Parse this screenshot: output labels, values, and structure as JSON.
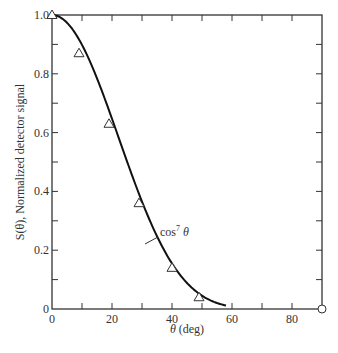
{
  "chart_data": {
    "type": "line",
    "title": "",
    "xlabel": "θ (deg)",
    "ylabel": "S(θ), Normalized detector signal",
    "xlim": [
      0,
      90
    ],
    "ylim": [
      0,
      1.0
    ],
    "x_ticks": [
      0,
      20,
      40,
      60,
      80
    ],
    "x_tick_labels": [
      "0",
      "20",
      "40",
      "60",
      "80"
    ],
    "x_minor_ticks": [
      10,
      30,
      50,
      70
    ],
    "y_ticks": [
      0,
      0.2,
      0.4,
      0.6,
      0.8,
      1.0
    ],
    "y_tick_labels": [
      "0",
      "0.2",
      "0.4",
      "0.6",
      "0.8",
      "1.0"
    ],
    "y_minor_ticks": [
      0.1,
      0.3,
      0.5,
      0.7,
      0.9
    ],
    "grid": false,
    "annotations": [
      {
        "text": "cos⁷ θ",
        "x": 36,
        "y": 0.27,
        "points_to": [
          31,
          0.22
        ]
      }
    ],
    "series": [
      {
        "name": "cos^7 θ",
        "kind": "curve",
        "function": "cos(theta)^7",
        "x_range": [
          0,
          90
        ]
      },
      {
        "name": "measured",
        "kind": "markers",
        "marker": "triangle-open",
        "x": [
          0,
          9,
          19,
          29,
          40,
          49
        ],
        "y": [
          1.0,
          0.87,
          0.63,
          0.36,
          0.14,
          0.04
        ]
      },
      {
        "name": "endpoint",
        "kind": "markers",
        "marker": "circle-open",
        "x": [
          90
        ],
        "y": [
          0
        ]
      }
    ]
  },
  "labels": {
    "xlabel_theta": "θ",
    "xlabel_unit": " (deg)",
    "ylabel": "S(θ), Normalized detector signal",
    "annotation_base": "cos",
    "annotation_exp": "7",
    "annotation_var": " θ"
  }
}
